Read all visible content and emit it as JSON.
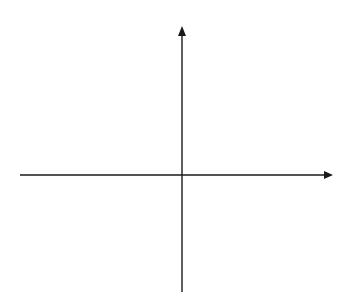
{
  "diagram": {
    "type": "cartesian-axes",
    "background": "#ffffff",
    "stroke_color": "#1a1a1a",
    "stroke_width": 1.4,
    "origin": {
      "x": 182,
      "y": 175
    },
    "x_axis": {
      "x_start": 20,
      "x_end": 333,
      "y": 175,
      "arrow": "right"
    },
    "y_axis": {
      "x": 182,
      "y_start": 292,
      "y_end": 26,
      "arrow": "up"
    }
  }
}
